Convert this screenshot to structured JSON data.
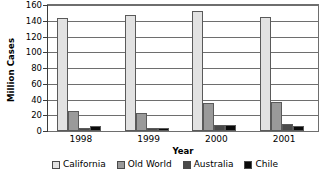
{
  "chart_data": {
    "type": "bar",
    "title": "",
    "xlabel": "Year",
    "ylabel": "Million Cases",
    "categories": [
      "1998",
      "1999",
      "2000",
      "2001"
    ],
    "series": [
      {
        "name": "California",
        "color": "#e2e2e2",
        "values": [
          143,
          147,
          152,
          145
        ]
      },
      {
        "name": "Old World",
        "color": "#9a9a9a",
        "values": [
          25,
          23,
          35,
          37
        ]
      },
      {
        "name": "Australia",
        "color": "#4a4a4a",
        "values": [
          4,
          4,
          8,
          9
        ]
      },
      {
        "name": "Chile",
        "color": "#0a0a0a",
        "values": [
          7,
          4,
          8,
          7
        ]
      }
    ],
    "ylim": [
      0,
      160
    ],
    "yticks": [
      0,
      20,
      40,
      60,
      80,
      100,
      120,
      140,
      160
    ],
    "ytick_labels": [
      "0",
      "20",
      "40",
      "60",
      "80",
      "100",
      "120",
      "140",
      "160"
    ],
    "grid": true,
    "legend_position": "bottom"
  },
  "axes": {
    "y_title": "Million Cases",
    "x_title": "Year"
  },
  "legend": {
    "items": [
      {
        "label": "California",
        "color": "#e2e2e2"
      },
      {
        "label": "Old World",
        "color": "#9a9a9a"
      },
      {
        "label": "Australia",
        "color": "#4a4a4a"
      },
      {
        "label": "Chile",
        "color": "#0a0a0a"
      }
    ]
  }
}
